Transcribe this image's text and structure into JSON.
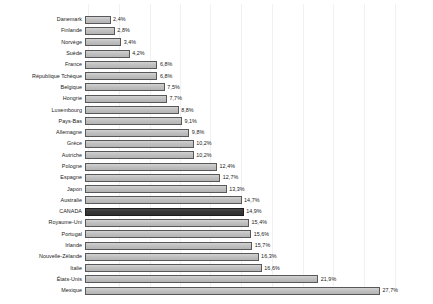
{
  "chart_data": {
    "type": "bar",
    "orientation": "horizontal",
    "title": "",
    "subtitle": "",
    "xlabel": "",
    "ylabel": "",
    "xlim": [
      0,
      29
    ],
    "grid": true,
    "legend": false,
    "value_suffix": "%",
    "decimal_separator": ",",
    "categories": [
      "Danemark",
      "Finlande",
      "Norvège",
      "Suède",
      "France",
      "République Tchèque",
      "Belgique",
      "Hongrie",
      "Luxembourg",
      "Pays-Bas",
      "Allemagne",
      "Grèce",
      "Autriche",
      "Pologne",
      "Espagne",
      "Japon",
      "Australie",
      "CANADA",
      "Royaume-Uni",
      "Portugal",
      "Irlande",
      "Nouvelle-Zélande",
      "Italie",
      "États-Unis",
      "Mexique"
    ],
    "values": [
      2.4,
      2.8,
      3.4,
      4.2,
      6.8,
      6.8,
      7.5,
      7.7,
      8.8,
      9.1,
      9.8,
      10.2,
      10.2,
      12.4,
      12.7,
      13.3,
      14.7,
      14.9,
      15.4,
      15.6,
      15.7,
      16.3,
      16.6,
      21.9,
      27.7
    ],
    "value_labels": [
      "2,4%",
      "2,8%",
      "3,4%",
      "4,2%",
      "6,8%",
      "6,8%",
      "7,5%",
      "7,7%",
      "8,8%",
      "9,1%",
      "9,8%",
      "10,2%",
      "10,2%",
      "12,4%",
      "12,7%",
      "13,3%",
      "14,7%",
      "14,9%",
      "15,4%",
      "15,6%",
      "15,7%",
      "16,3%",
      "16,6%",
      "21,9%",
      "27,7%"
    ],
    "highlighted_category": "CANADA",
    "colors": {
      "bar": "#c3c3c3",
      "bar_border": "#58585a",
      "highlight_bar": "#3c3c3c",
      "highlight_border": "#1d1d1d",
      "gridline": "#f1f1f1",
      "text": "#1a1a1a",
      "background": "#ffffff"
    },
    "gridline_values": [
      0,
      2.9,
      5.8,
      8.6,
      11.5,
      14.4,
      17.3,
      20.2,
      23,
      25.9,
      28.8
    ]
  }
}
